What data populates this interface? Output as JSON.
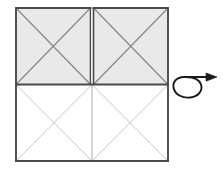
{
  "diagram": {
    "title": "Paper folding diagram with flip arrow",
    "caption": "",
    "background_color": "#ffffff"
  },
  "colors": {
    "shaded_fill": "#e9e9e9",
    "unshaded_fill": "#ffffff",
    "outer_border": "#4a4a4a",
    "shaded_diagonal": "#8a8a8a",
    "unshaded_diagonal": "#c9c9c9",
    "center_divider": "#adadad",
    "arrow": "#1a1a1a"
  },
  "geometry": {
    "left": 16,
    "right": 168,
    "top": 8,
    "bottom": 161,
    "mid_y": 84.5,
    "mid_x": 92,
    "split_gap": 3
  },
  "panels": [
    {
      "name": "top-left-panel",
      "state": "shaded",
      "fill": "#e9e9e9",
      "diagonals": "X",
      "x": 16,
      "y": 8,
      "width": 74.5,
      "height": 76.5
    },
    {
      "name": "top-right-panel",
      "state": "shaded",
      "fill": "#e9e9e9",
      "diagonals": "X",
      "x": 93.5,
      "y": 8,
      "width": 74.5,
      "height": 76.5
    },
    {
      "name": "bottom-left-panel",
      "state": "unshaded",
      "fill": "#ffffff",
      "diagonals": "X",
      "x": 16,
      "y": 84.5,
      "width": 76,
      "height": 76.5
    },
    {
      "name": "bottom-right-panel",
      "state": "unshaded",
      "fill": "#ffffff",
      "diagonals": "X",
      "x": 92,
      "y": 84.5,
      "width": 76,
      "height": 76.5
    }
  ],
  "arrow": {
    "name": "flip-over-arrow",
    "label": "flip",
    "direction": "right",
    "style": "loop-with-arrowhead",
    "x": 175,
    "y": 72,
    "width": 42,
    "height": 26,
    "loop_cx": 189,
    "loop_cy": 88,
    "loop_rx": 13,
    "loop_ry": 9.5,
    "shaft_y": 77,
    "shaft_x1": 176,
    "shaft_x2": 213,
    "arrowhead_tip_x": 216
  }
}
